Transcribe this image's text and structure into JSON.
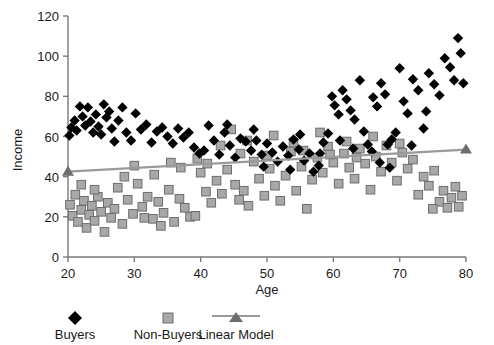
{
  "chart_data": {
    "type": "scatter",
    "title": "",
    "xlabel": "Age",
    "ylabel": "Income",
    "xlim": [
      20,
      80
    ],
    "ylim": [
      0,
      120
    ],
    "xticks": [
      20,
      30,
      40,
      50,
      60,
      70,
      80
    ],
    "yticks": [
      0,
      20,
      40,
      60,
      80,
      100,
      120
    ],
    "grid": false,
    "legend_position": "bottom",
    "legend": [
      "Buyers",
      "Non-Buyers",
      "Linear Model"
    ],
    "colors": {
      "buyers": "#000000",
      "non_buyers": "#a8a8a8",
      "non_buyers_edge": "#6e6e6e",
      "linear_model": "#9a9a9a",
      "axis": "#7a7a7a",
      "text": "#1a1a1a",
      "background": "#ffffff"
    },
    "series": [
      {
        "name": "Buyers",
        "marker": "diamond",
        "points": [
          [
            20.2,
            60.5
          ],
          [
            20.5,
            64.5
          ],
          [
            21.0,
            68.0
          ],
          [
            21.3,
            63.0
          ],
          [
            21.8,
            75.0
          ],
          [
            22.2,
            70.0
          ],
          [
            22.6,
            65.5
          ],
          [
            23.0,
            74.5
          ],
          [
            23.4,
            67.5
          ],
          [
            23.8,
            62.0
          ],
          [
            24.2,
            71.0
          ],
          [
            24.6,
            65.0
          ],
          [
            25.0,
            61.0
          ],
          [
            25.4,
            76.0
          ],
          [
            25.8,
            69.5
          ],
          [
            26.2,
            72.5
          ],
          [
            26.6,
            64.0
          ],
          [
            27.0,
            57.5
          ],
          [
            27.6,
            68.0
          ],
          [
            28.2,
            74.5
          ],
          [
            28.8,
            62.0
          ],
          [
            29.5,
            58.0
          ],
          [
            30.2,
            71.5
          ],
          [
            31.0,
            63.5
          ],
          [
            31.8,
            66.0
          ],
          [
            32.6,
            57.0
          ],
          [
            33.4,
            62.5
          ],
          [
            34.2,
            64.5
          ],
          [
            35.0,
            60.0
          ],
          [
            35.8,
            56.5
          ],
          [
            36.6,
            64.0
          ],
          [
            37.4,
            59.5
          ],
          [
            38.2,
            62.0
          ],
          [
            39.0,
            54.5
          ],
          [
            39.8,
            51.5
          ],
          [
            40.5,
            53.0
          ],
          [
            41.2,
            65.5
          ],
          [
            42.0,
            58.0
          ],
          [
            42.8,
            51.0
          ],
          [
            43.6,
            62.0
          ],
          [
            44.4,
            55.5
          ],
          [
            45.2,
            49.5
          ],
          [
            46.0,
            59.0
          ],
          [
            46.8,
            57.5
          ],
          [
            47.6,
            53.0
          ],
          [
            48.4,
            58.0
          ],
          [
            49.2,
            51.0
          ],
          [
            50.0,
            56.5
          ],
          [
            50.8,
            52.0
          ],
          [
            51.6,
            47.5
          ],
          [
            52.4,
            55.0
          ],
          [
            53.2,
            50.5
          ],
          [
            54.0,
            58.5
          ],
          [
            54.8,
            53.5
          ],
          [
            55.6,
            48.0
          ],
          [
            56.4,
            51.5
          ],
          [
            57.0,
            42.5
          ],
          [
            57.8,
            45.5
          ],
          [
            58.5,
            57.0
          ],
          [
            59.2,
            61.5
          ],
          [
            59.8,
            80.0
          ],
          [
            60.2,
            75.5
          ],
          [
            60.8,
            71.0
          ],
          [
            61.4,
            83.0
          ],
          [
            62.0,
            78.5
          ],
          [
            62.6,
            73.0
          ],
          [
            63.2,
            68.5
          ],
          [
            64.0,
            88.0
          ],
          [
            64.6,
            62.5
          ],
          [
            65.2,
            56.0
          ],
          [
            66.0,
            79.5
          ],
          [
            66.6,
            75.0
          ],
          [
            67.2,
            86.5
          ],
          [
            67.8,
            81.0
          ],
          [
            68.2,
            56.0
          ],
          [
            68.8,
            58.5
          ],
          [
            69.4,
            62.0
          ],
          [
            70.0,
            94.0
          ],
          [
            70.6,
            77.5
          ],
          [
            71.2,
            71.5
          ],
          [
            72.0,
            88.5
          ],
          [
            72.8,
            83.0
          ],
          [
            73.6,
            64.0
          ],
          [
            74.4,
            91.5
          ],
          [
            75.2,
            86.0
          ],
          [
            76.0,
            80.5
          ],
          [
            76.8,
            99.0
          ],
          [
            77.6,
            94.5
          ],
          [
            78.2,
            88.0
          ],
          [
            78.8,
            109.0
          ],
          [
            79.2,
            101.5
          ],
          [
            79.6,
            86.5
          ],
          [
            44.0,
            66.0
          ],
          [
            48.0,
            63.5
          ],
          [
            55.0,
            61.0
          ],
          [
            63.0,
            54.0
          ],
          [
            67.0,
            47.0
          ],
          [
            68.5,
            44.5
          ],
          [
            49.5,
            45.0
          ],
          [
            53.5,
            43.5
          ],
          [
            58.0,
            51.5
          ],
          [
            61.0,
            58.0
          ],
          [
            65.8,
            52.5
          ],
          [
            71.8,
            55.5
          ],
          [
            74.0,
            72.5
          ]
        ]
      },
      {
        "name": "Non-Buyers",
        "marker": "square",
        "points": [
          [
            20.3,
            26.0
          ],
          [
            20.7,
            20.5
          ],
          [
            21.1,
            31.0
          ],
          [
            21.5,
            17.5
          ],
          [
            22.0,
            23.5
          ],
          [
            22.4,
            28.0
          ],
          [
            22.8,
            14.5
          ],
          [
            23.2,
            21.0
          ],
          [
            23.6,
            25.5
          ],
          [
            24.0,
            18.0
          ],
          [
            24.5,
            30.0
          ],
          [
            25.0,
            22.5
          ],
          [
            25.5,
            12.5
          ],
          [
            26.0,
            27.0
          ],
          [
            26.5,
            19.5
          ],
          [
            27.0,
            24.0
          ],
          [
            27.5,
            34.5
          ],
          [
            28.2,
            16.5
          ],
          [
            29.0,
            28.5
          ],
          [
            29.8,
            21.5
          ],
          [
            30.5,
            36.5
          ],
          [
            31.2,
            25.0
          ],
          [
            32.0,
            30.0
          ],
          [
            32.8,
            19.0
          ],
          [
            33.6,
            27.5
          ],
          [
            34.4,
            22.0
          ],
          [
            35.2,
            33.5
          ],
          [
            36.0,
            17.5
          ],
          [
            36.8,
            29.0
          ],
          [
            37.6,
            24.5
          ],
          [
            38.4,
            20.0
          ],
          [
            39.2,
            20.5
          ],
          [
            40.0,
            42.0
          ],
          [
            40.8,
            32.5
          ],
          [
            41.6,
            27.0
          ],
          [
            42.4,
            38.0
          ],
          [
            43.2,
            31.5
          ],
          [
            44.0,
            43.5
          ],
          [
            44.6,
            63.5
          ],
          [
            45.2,
            36.0
          ],
          [
            45.8,
            28.5
          ],
          [
            46.5,
            33.0
          ],
          [
            47.2,
            25.5
          ],
          [
            48.0,
            47.5
          ],
          [
            48.8,
            39.0
          ],
          [
            49.6,
            30.5
          ],
          [
            50.4,
            44.0
          ],
          [
            51.2,
            35.5
          ],
          [
            52.0,
            28.0
          ],
          [
            52.8,
            40.5
          ],
          [
            53.6,
            52.5
          ],
          [
            54.4,
            33.0
          ],
          [
            55.2,
            45.0
          ],
          [
            56.0,
            24.0
          ],
          [
            56.8,
            38.5
          ],
          [
            57.6,
            49.5
          ],
          [
            58.4,
            42.0
          ],
          [
            59.2,
            55.0
          ],
          [
            60.0,
            47.0
          ],
          [
            60.8,
            36.5
          ],
          [
            61.6,
            51.5
          ],
          [
            62.4,
            44.5
          ],
          [
            63.2,
            39.0
          ],
          [
            64.0,
            54.0
          ],
          [
            64.8,
            46.5
          ],
          [
            65.6,
            33.5
          ],
          [
            66.4,
            50.0
          ],
          [
            67.2,
            42.5
          ],
          [
            68.0,
            55.5
          ],
          [
            68.8,
            47.0
          ],
          [
            69.6,
            38.0
          ],
          [
            70.4,
            52.0
          ],
          [
            71.2,
            44.0
          ],
          [
            72.0,
            48.5
          ],
          [
            72.8,
            31.0
          ],
          [
            73.6,
            40.0
          ],
          [
            74.4,
            35.5
          ],
          [
            75.2,
            43.0
          ],
          [
            76.0,
            27.5
          ],
          [
            76.6,
            33.0
          ],
          [
            77.2,
            24.5
          ],
          [
            77.8,
            29.5
          ],
          [
            78.4,
            35.0
          ],
          [
            78.9,
            25.0
          ],
          [
            79.4,
            30.5
          ],
          [
            33.0,
            41.0
          ],
          [
            37.0,
            44.5
          ],
          [
            41.0,
            46.5
          ],
          [
            43.0,
            55.5
          ],
          [
            47.0,
            58.0
          ],
          [
            51.0,
            60.5
          ],
          [
            54.0,
            57.0
          ],
          [
            58.0,
            62.0
          ],
          [
            62.0,
            57.5
          ],
          [
            66.0,
            60.0
          ],
          [
            30.0,
            45.5
          ],
          [
            35.5,
            47.0
          ],
          [
            39.5,
            49.0
          ],
          [
            46.0,
            51.5
          ],
          [
            50.0,
            50.5
          ],
          [
            55.5,
            53.0
          ],
          [
            59.5,
            51.0
          ],
          [
            63.5,
            49.5
          ],
          [
            70.0,
            56.5
          ],
          [
            75.0,
            24.0
          ],
          [
            22.0,
            36.0
          ],
          [
            24.0,
            33.5
          ],
          [
            28.5,
            40.0
          ],
          [
            31.5,
            19.5
          ],
          [
            34.0,
            15.5
          ]
        ]
      }
    ],
    "linear_model": {
      "name": "Linear Model",
      "x_start": 20,
      "y_start": 42.5,
      "x_end": 80,
      "y_end": 53.5,
      "endpoint_marker": "triangle"
    }
  }
}
